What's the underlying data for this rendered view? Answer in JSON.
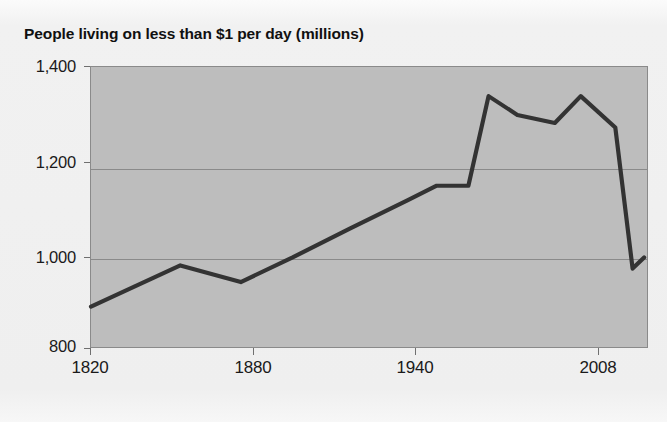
{
  "figure": {
    "title": "People living on less than $1 per day (millions)",
    "background_color": "#f1f1f1",
    "plot_fill_color": "#bdbdbd",
    "line_color": "#333333",
    "grid_color": "#8a8a8a"
  },
  "chart_data": {
    "type": "line",
    "title": "People living on less than $1 per day (millions)",
    "xlabel": "",
    "ylabel": "",
    "xlim": [
      1820,
      2013
    ],
    "ylim": [
      800,
      1425
    ],
    "grid": "horizontal",
    "legend": "none",
    "xticks": [
      1820,
      1880,
      1940,
      2008
    ],
    "xtick_labels": [
      "1820",
      "1880",
      "1940",
      "2008"
    ],
    "yticks": [
      800,
      1000,
      1200,
      1400
    ],
    "ytick_labels": [
      "800",
      "1,000",
      "1,200",
      "1,400"
    ],
    "series": [
      {
        "name": "People living on less than $1 per day (millions)",
        "x": [
          1820,
          1851,
          1872,
          1890,
          1910,
          1930,
          1940,
          1951,
          1958,
          1968,
          1981,
          1990,
          2002,
          2008,
          2012
        ],
        "values": [
          890,
          982,
          945,
          1000,
          1065,
          1128,
          1160,
          1160,
          1360,
          1318,
          1300,
          1360,
          1290,
          975,
          1000
        ]
      }
    ]
  },
  "axes": {
    "y_ticks": [
      {
        "label": "1,400",
        "value": 1400
      },
      {
        "label": "1,200",
        "value": 1200
      },
      {
        "label": "1,000",
        "value": 1000
      },
      {
        "label": "800",
        "value": 800
      }
    ],
    "x_ticks": [
      {
        "label": "1820",
        "value": 1820
      },
      {
        "label": "1880",
        "value": 1880
      },
      {
        "label": "1940",
        "value": 1940
      },
      {
        "label": "2008",
        "value": 2008
      }
    ]
  }
}
